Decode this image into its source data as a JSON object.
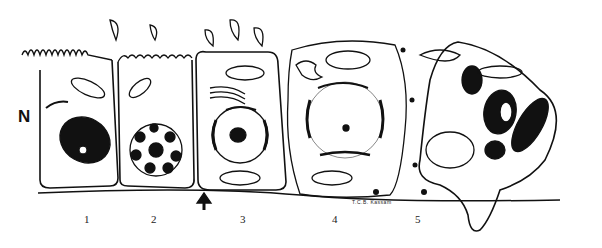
{
  "figure": {
    "side_label": "N",
    "cell_labels": [
      "1",
      "2",
      "3",
      "4",
      "5"
    ],
    "signature": "T.C.B. Kassam",
    "colors": {
      "ink": "#111111",
      "background": "#ffffff"
    }
  }
}
